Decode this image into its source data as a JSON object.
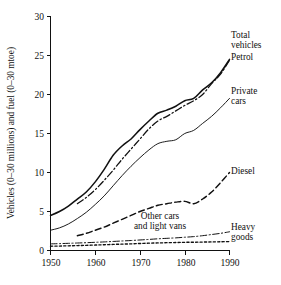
{
  "chart_data": {
    "type": "line",
    "title": "",
    "xlabel": "",
    "ylabel": "Vehicles (0–30 millions) and fuel (0–30 mtoe)",
    "xlim": [
      1950,
      1990
    ],
    "ylim": [
      0,
      30
    ],
    "xticks": [
      "1950",
      "1960",
      "1970",
      "1980",
      "1990"
    ],
    "yticks": [
      "0",
      "5",
      "10",
      "15",
      "20",
      "25",
      "30"
    ],
    "grid": false,
    "legend_position": "inline-right-labels",
    "x": [
      1950,
      1952,
      1954,
      1956,
      1958,
      1960,
      1962,
      1964,
      1966,
      1968,
      1970,
      1972,
      1974,
      1976,
      1978,
      1980,
      1982,
      1984,
      1986,
      1988,
      1990
    ],
    "series": [
      {
        "name": "Total vehicles",
        "style": "solid-bold",
        "label": "Total vehicles",
        "values": [
          4.5,
          5.0,
          5.7,
          6.6,
          7.5,
          8.8,
          10.4,
          12.2,
          13.4,
          14.3,
          15.5,
          16.6,
          17.6,
          18.0,
          18.5,
          19.2,
          19.5,
          20.6,
          21.5,
          22.8,
          24.5
        ]
      },
      {
        "name": "Petrol",
        "style": "dash-dot",
        "label": "Petrol",
        "values": [
          null,
          null,
          null,
          6.0,
          6.8,
          7.8,
          9.0,
          10.3,
          11.7,
          13.0,
          14.3,
          15.6,
          16.6,
          17.2,
          17.9,
          18.6,
          19.2,
          20.0,
          21.4,
          22.6,
          24.4
        ]
      },
      {
        "name": "Private cars",
        "style": "solid-thin",
        "label": "Private cars",
        "values": [
          2.6,
          2.9,
          3.4,
          4.1,
          4.9,
          5.9,
          7.0,
          8.3,
          9.6,
          10.8,
          11.9,
          12.9,
          13.7,
          14.0,
          14.2,
          15.0,
          15.4,
          16.3,
          17.2,
          18.3,
          19.5
        ]
      },
      {
        "name": "Diesel",
        "style": "dashed",
        "label": "Diesel",
        "values": [
          null,
          null,
          null,
          1.9,
          2.2,
          2.6,
          3.0,
          3.5,
          4.0,
          4.5,
          5.0,
          5.4,
          5.8,
          6.0,
          6.2,
          6.3,
          6.0,
          6.6,
          7.5,
          8.7,
          10.0
        ]
      },
      {
        "name": "Other cars and light vans",
        "style": "dash-dot-thin",
        "label": "Other cars and light vans",
        "values": [
          0.85,
          0.88,
          0.92,
          0.96,
          1.0,
          1.05,
          1.1,
          1.16,
          1.22,
          1.28,
          1.35,
          1.42,
          1.5,
          1.56,
          1.62,
          1.7,
          1.78,
          1.9,
          2.05,
          2.2,
          2.4
        ]
      },
      {
        "name": "Heavy goods",
        "style": "dotted",
        "label": "Heavy goods",
        "values": [
          0.55,
          0.57,
          0.6,
          0.63,
          0.66,
          0.7,
          0.74,
          0.78,
          0.82,
          0.85,
          0.9,
          0.94,
          0.97,
          1.0,
          1.02,
          1.05,
          1.06,
          1.08,
          1.1,
          1.12,
          1.15
        ]
      }
    ],
    "annotations": [
      {
        "text": "Total vehicles",
        "series": "Total vehicles"
      },
      {
        "text": "Petrol",
        "series": "Petrol"
      },
      {
        "text": "Private cars",
        "series": "Private cars"
      },
      {
        "text": "Diesel",
        "series": "Diesel"
      },
      {
        "text": "Other cars and light vans",
        "series": "Other cars and light vans"
      },
      {
        "text": "Heavy goods",
        "series": "Heavy goods"
      }
    ]
  },
  "labels": {
    "y_axis_title": "Vehicles (0–30 millions) and fuel (0–30 mtoe)",
    "total_vehicles_line1": "Total",
    "total_vehicles_line2": "vehicles",
    "petrol": "Petrol",
    "private_cars_line1": "Private",
    "private_cars_line2": "cars",
    "diesel": "Diesel",
    "other_cars_line1": "Other cars",
    "other_cars_line2": "and light vans",
    "heavy_goods_line1": "Heavy",
    "heavy_goods_line2": "goods"
  },
  "ticks": {
    "y": [
      "30",
      "25",
      "20",
      "15",
      "10",
      "5",
      "0"
    ],
    "x": [
      "1950",
      "1960",
      "1970",
      "1980",
      "1990"
    ]
  },
  "colors": {
    "ink": "#111111",
    "background": "#ffffff"
  }
}
